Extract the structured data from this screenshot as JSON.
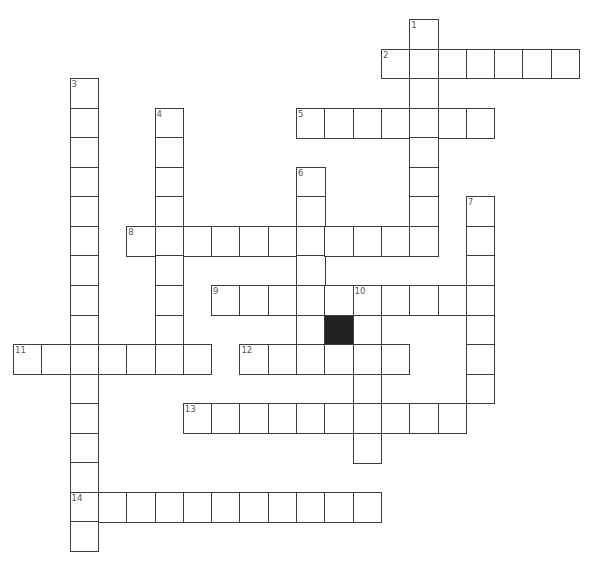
{
  "puzzle": {
    "grid": {
      "origin_x": 13,
      "origin_y": 19,
      "cell_width": 28.3,
      "cell_height": 29.55,
      "border_color": "#3c3c3c",
      "black_cell_color": "#222222",
      "number_color": "#555555"
    },
    "entries": [
      {
        "number": "1",
        "direction": "down",
        "col": 14,
        "row": 0,
        "length": 8
      },
      {
        "number": "2",
        "direction": "across",
        "col": 13,
        "row": 1,
        "length": 7
      },
      {
        "number": "3",
        "direction": "down",
        "col": 2,
        "row": 2,
        "length": 16
      },
      {
        "number": "4",
        "direction": "down",
        "col": 5,
        "row": 3,
        "length": 9
      },
      {
        "number": "5",
        "direction": "across",
        "col": 10,
        "row": 3,
        "length": 7
      },
      {
        "number": "6",
        "direction": "down",
        "col": 10,
        "row": 5,
        "length": 7
      },
      {
        "number": "7",
        "direction": "down",
        "col": 16,
        "row": 6,
        "length": 7
      },
      {
        "number": "8",
        "direction": "across",
        "col": 4,
        "row": 7,
        "length": 11
      },
      {
        "number": "9",
        "direction": "across",
        "col": 7,
        "row": 9,
        "length": 10
      },
      {
        "number": "10",
        "direction": "down",
        "col": 12,
        "row": 9,
        "length": 6
      },
      {
        "number": "11",
        "direction": "across",
        "col": 0,
        "row": 11,
        "length": 7
      },
      {
        "number": "12",
        "direction": "across",
        "col": 8,
        "row": 11,
        "length": 6
      },
      {
        "number": "13",
        "direction": "across",
        "col": 6,
        "row": 13,
        "length": 10
      },
      {
        "number": "14",
        "direction": "across",
        "col": 2,
        "row": 16,
        "length": 11
      }
    ],
    "black_cells": [
      {
        "col": 11,
        "row": 10
      }
    ]
  }
}
